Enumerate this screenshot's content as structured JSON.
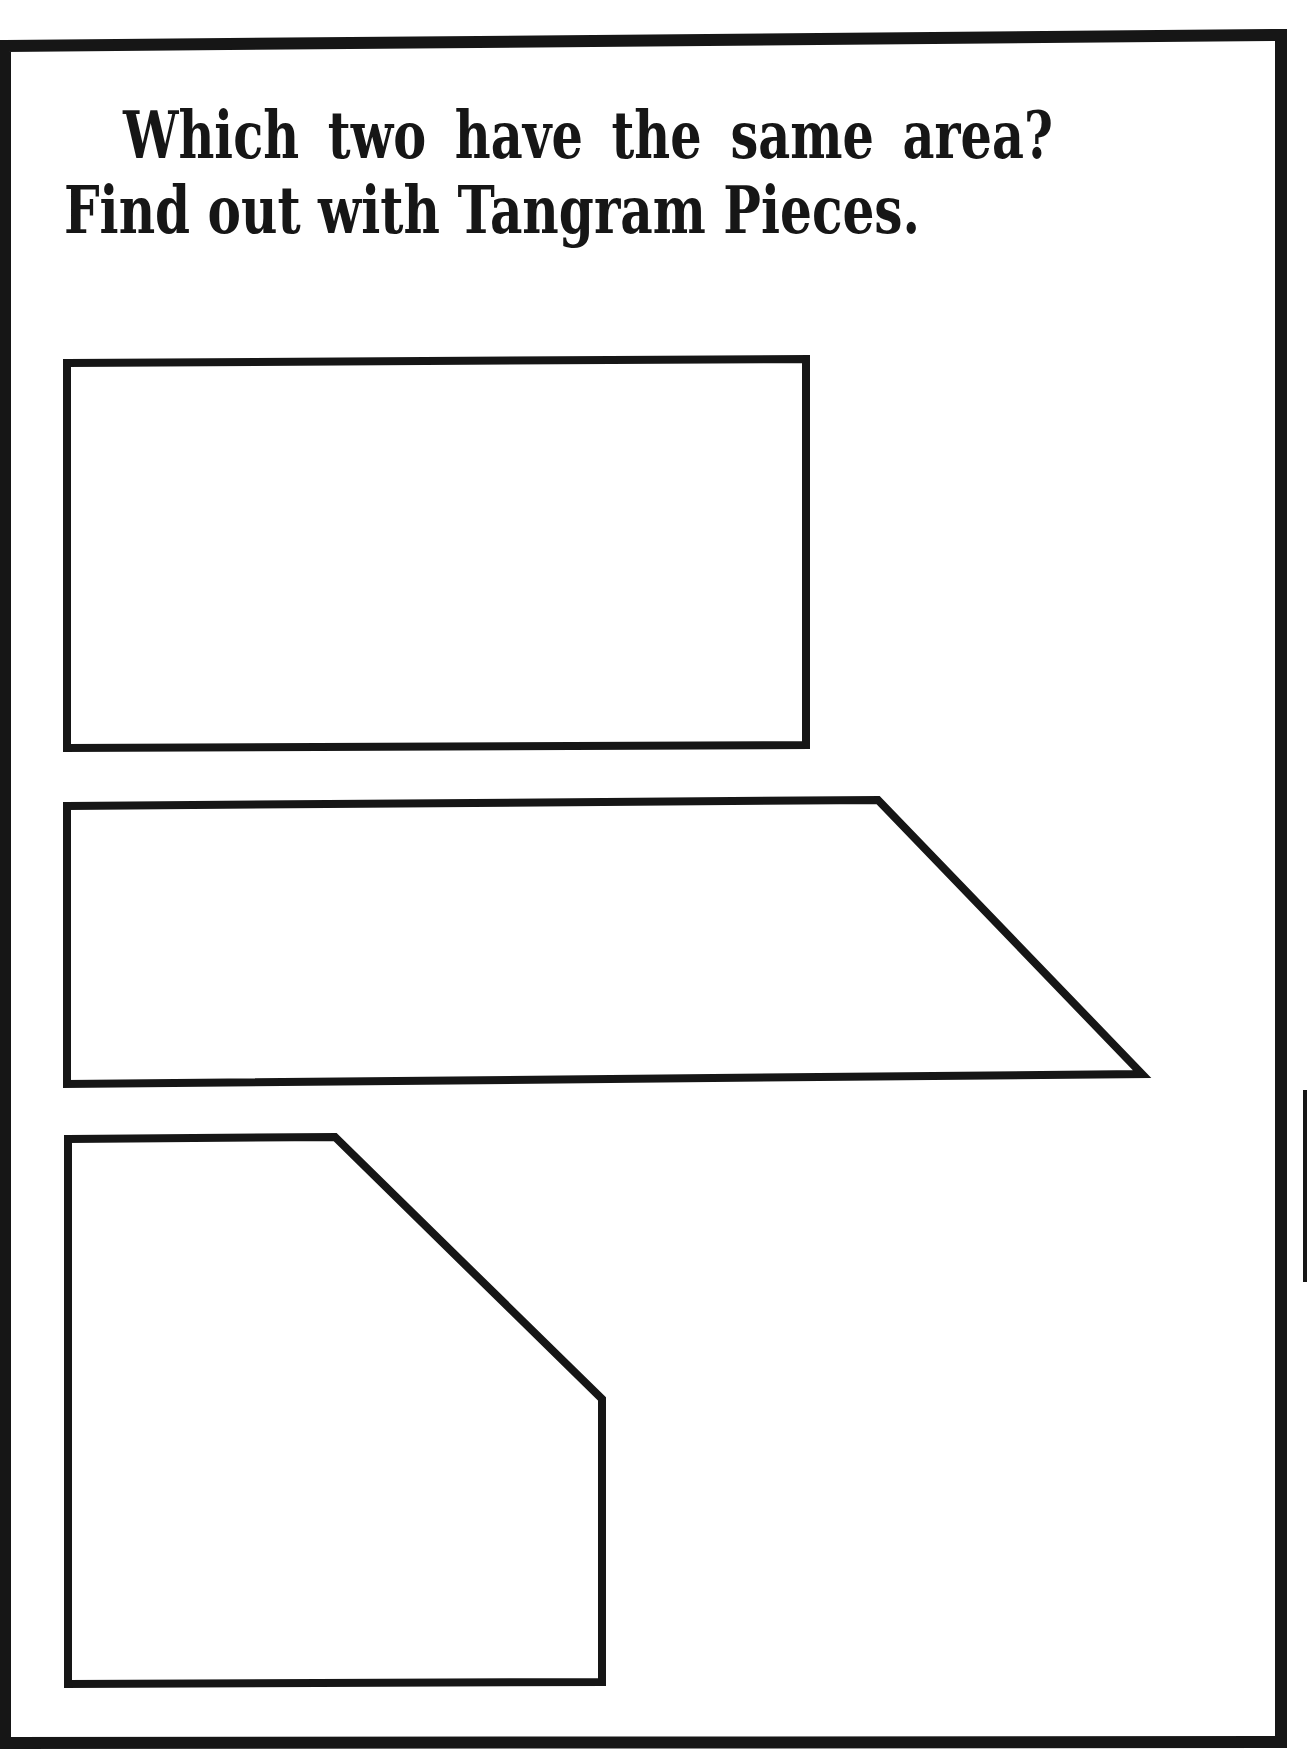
{
  "worksheet": {
    "title_line_1": "Which two have the same area?",
    "title_line_2": "Find out with Tangram Pieces.",
    "ink_color": "#161616",
    "paper_color": "#ffffff"
  },
  "shapes": [
    {
      "name": "rectangle",
      "points": "67,363 806,359 806,745 67,748"
    },
    {
      "name": "trapezoid",
      "points": "67,806 878,800 1142,1074 67,1084"
    },
    {
      "name": "pentagon",
      "points": "68,1139 335,1137 602,1399 602,1682 68,1684"
    }
  ]
}
